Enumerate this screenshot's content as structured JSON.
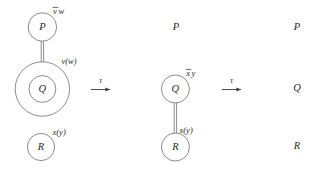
{
  "figure": {
    "ink_color": "#6f6f6f",
    "text_color": "#2a2a2a",
    "background": "#ffffff"
  },
  "stages": [
    {
      "id": "stage-1",
      "nodes": [
        {
          "id": "p1",
          "label": "P",
          "shape": "circle"
        },
        {
          "id": "q1",
          "label": "Q",
          "shape": "double-circle"
        },
        {
          "id": "r1",
          "label": "R",
          "shape": "circle"
        }
      ],
      "edges": [
        {
          "id": "p1-q1",
          "from": "p1",
          "to": "q1",
          "style": "double-line"
        }
      ],
      "action_labels": [
        {
          "id": "p1-action",
          "text": "vw",
          "overbar": "v",
          "on": "p1"
        },
        {
          "id": "q1-action",
          "text": "v(w)",
          "overbar": "",
          "on": "q1"
        },
        {
          "id": "r1-action",
          "text": "x(y)",
          "overbar": "",
          "on": "r1"
        }
      ]
    },
    {
      "id": "stage-2",
      "nodes": [
        {
          "id": "p2",
          "label": "P",
          "shape": "none"
        },
        {
          "id": "q2",
          "label": "Q",
          "shape": "circle"
        },
        {
          "id": "r2",
          "label": "R",
          "shape": "circle"
        }
      ],
      "edges": [
        {
          "id": "q2-r2",
          "from": "q2",
          "to": "r2",
          "style": "double-line"
        }
      ],
      "action_labels": [
        {
          "id": "q2-action",
          "text": "xy",
          "overbar": "x",
          "on": "q2"
        },
        {
          "id": "r2-action",
          "text": "x(y)",
          "overbar": "",
          "on": "r2"
        }
      ]
    },
    {
      "id": "stage-3",
      "nodes": [
        {
          "id": "p3",
          "label": "P",
          "shape": "none"
        },
        {
          "id": "q3",
          "label": "Q",
          "shape": "none"
        },
        {
          "id": "r3",
          "label": "R",
          "shape": "none"
        }
      ],
      "edges": [],
      "action_labels": []
    }
  ],
  "transitions": [
    {
      "id": "arrow-1",
      "label": "τ",
      "from_stage": "stage-1",
      "to_stage": "stage-2"
    },
    {
      "id": "arrow-2",
      "label": "τ",
      "from_stage": "stage-2",
      "to_stage": "stage-3"
    }
  ],
  "labels": {
    "p1": "P",
    "q1": "Q",
    "r1": "R",
    "p2": "P",
    "q2": "Q",
    "r2": "R",
    "p3": "P",
    "q3": "Q",
    "r3": "R",
    "vbar": "v",
    "w_after_vbar": "w",
    "vw_paren": "v(w)",
    "xy_paren": "x(y)",
    "xbar": "x",
    "y_after_xbar": "y",
    "xy_paren_2": "x(y)",
    "tau_1": "τ",
    "tau_2": "τ"
  }
}
